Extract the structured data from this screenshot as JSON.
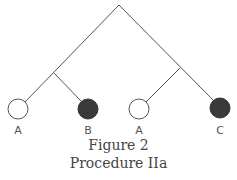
{
  "figure": {
    "caption_line1": "Figure 2",
    "caption_line2": "Procedure IIa"
  },
  "tree": {
    "leaves": [
      {
        "label": "A",
        "fill": "white"
      },
      {
        "label": "B",
        "fill": "dark"
      },
      {
        "label": "A",
        "fill": "white"
      },
      {
        "label": "C",
        "fill": "dark"
      }
    ]
  },
  "colors": {
    "line": "#555555",
    "dark_fill": "#3a3a3a",
    "label": "#555555"
  }
}
